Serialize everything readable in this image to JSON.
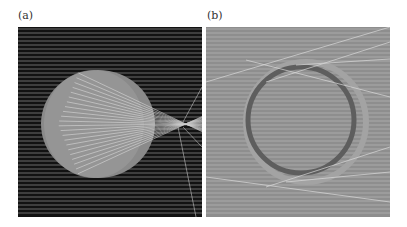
{
  "figure": {
    "panels": [
      {
        "label": "(a)",
        "background": "#121212",
        "line_color": "#d0d0d0",
        "disk_color": "#8e8e8e"
      },
      {
        "label": "(b)",
        "background": "#8f8f8f",
        "line_color": "#d6d6d6",
        "ring_color": "#6a6a6a"
      }
    ]
  }
}
